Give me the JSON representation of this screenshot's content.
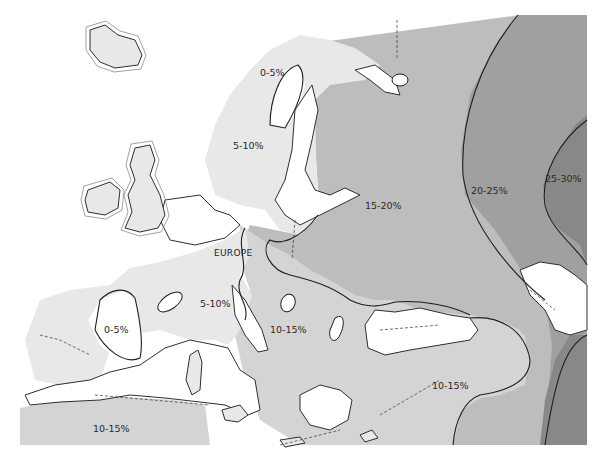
{
  "map": {
    "title": "",
    "region_label": "EUROPE",
    "zones": [
      {
        "id": "scandinavia-5-10",
        "label": "5-10%",
        "range_percent": [
          5,
          10
        ],
        "color": "#e6e6e6"
      },
      {
        "id": "scandinavia-0-5",
        "label": "0-5%",
        "range_percent": [
          0,
          5
        ],
        "color": "#ffffff"
      },
      {
        "id": "western-europe-5-10",
        "label": "5-10%",
        "range_percent": [
          5,
          10
        ],
        "color": "#e6e6e6"
      },
      {
        "id": "iberia-0-5",
        "label": "0-5%",
        "range_percent": [
          0,
          5
        ],
        "color": "#ffffff"
      },
      {
        "id": "central-europe-10-15",
        "label": "10-15%",
        "range_percent": [
          10,
          15
        ],
        "color": "#d2d2d2"
      },
      {
        "id": "eastern-europe-15-20",
        "label": "15-20%",
        "range_percent": [
          15,
          20
        ],
        "color": "#b9b9b9"
      },
      {
        "id": "russia-20-25",
        "label": "20-25%",
        "range_percent": [
          20,
          25
        ],
        "color": "#9c9c9c"
      },
      {
        "id": "russia-25-30",
        "label": "25-30%",
        "range_percent": [
          25,
          30
        ],
        "color": "#858585"
      },
      {
        "id": "anatolia-10-15",
        "label": "10-15%",
        "range_percent": [
          10,
          15
        ],
        "color": "#d2d2d2"
      },
      {
        "id": "north-africa-10-15",
        "label": "10-15%",
        "range_percent": [
          10,
          15
        ],
        "color": "#d2d2d2"
      }
    ],
    "colors": {
      "water": "#ffffff",
      "coastline": "#2e2e2e",
      "isoline": "#1e1e1e"
    }
  }
}
